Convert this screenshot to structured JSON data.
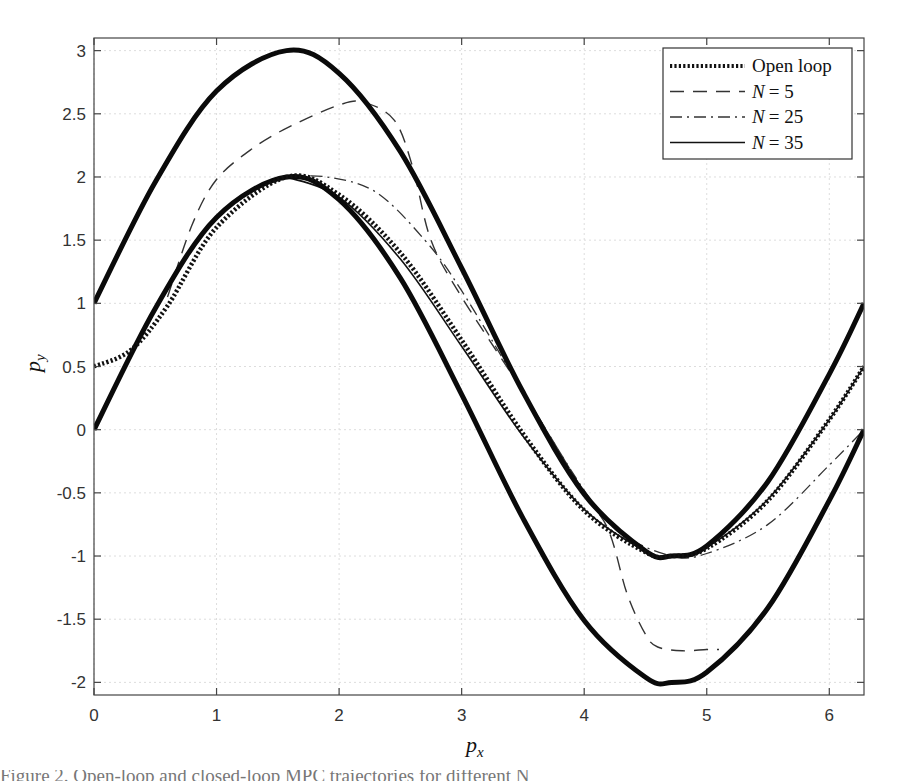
{
  "chart_data": {
    "type": "line",
    "title": "",
    "xlabel": "p_x",
    "ylabel": "p_y",
    "xlim": [
      0,
      6.2832
    ],
    "ylim": [
      -2.1,
      3.1
    ],
    "xticks": [
      0,
      1,
      2,
      3,
      4,
      5,
      6
    ],
    "xtick_labels": [
      "0",
      "1",
      "2",
      "3",
      "4",
      "5",
      "6"
    ],
    "yticks": [
      3,
      2.5,
      2,
      1.5,
      1,
      0.5,
      0,
      -0.5,
      -1,
      -1.5,
      -2
    ],
    "ytick_labels": [
      "3",
      "2.5",
      "2",
      "1.5",
      "1",
      "0.5",
      "0",
      "-0.5",
      "-1",
      "-1.5",
      "-2"
    ],
    "grid": true,
    "legend_position": "upper right",
    "legend": [
      {
        "label": "Open loop",
        "style": "dotted-thick"
      },
      {
        "label_var": "N",
        "label_eq": "= 5",
        "style": "dashed"
      },
      {
        "label_var": "N",
        "label_eq": "= 25",
        "style": "dash-dot"
      },
      {
        "label_var": "N",
        "label_eq": "= 35",
        "style": "solid-thin"
      }
    ],
    "series": [
      {
        "name": "Upper bound",
        "style": "solid-thick",
        "x": [
          0,
          0.5,
          1.0,
          1.5708,
          2.0,
          2.5,
          3.0,
          3.5,
          4.0,
          4.5,
          4.7124,
          5.0,
          5.5,
          6.0,
          6.2832
        ],
        "y": [
          1.0,
          1.96,
          2.68,
          3.0,
          2.82,
          2.2,
          1.28,
          0.3,
          -0.51,
          -0.96,
          -1.0,
          -0.92,
          -0.41,
          0.44,
          1.0
        ]
      },
      {
        "name": "Lower bound",
        "style": "solid-thick",
        "x": [
          0,
          0.5,
          1.0,
          1.5708,
          2.0,
          2.5,
          3.0,
          3.5,
          4.0,
          4.5,
          4.7124,
          5.0,
          5.5,
          6.0,
          6.2832
        ],
        "y": [
          0.0,
          0.96,
          1.68,
          2.0,
          1.82,
          1.2,
          0.28,
          -0.7,
          -1.51,
          -1.96,
          -2.0,
          -1.92,
          -1.41,
          -0.56,
          0.0
        ]
      },
      {
        "name": "Open loop",
        "style": "dotted-thick",
        "x": [
          0,
          0.3,
          0.6,
          1.0,
          1.5708,
          2.0,
          2.5,
          3.0,
          3.5,
          4.0,
          4.5,
          4.7124,
          5.0,
          5.5,
          6.0,
          6.2832
        ],
        "y": [
          0.5,
          0.63,
          0.98,
          1.6,
          2.0,
          1.86,
          1.4,
          0.71,
          -0.03,
          -0.64,
          -0.97,
          -1.0,
          -0.94,
          -0.56,
          0.08,
          0.5
        ]
      },
      {
        "name": "N = 5",
        "style": "dashed",
        "x": [
          0.6,
          0.8,
          1.0,
          1.3,
          1.6,
          2.0,
          2.2,
          2.45,
          2.6,
          2.75,
          3.0,
          3.5,
          4.0,
          4.2,
          4.35,
          4.5,
          4.6,
          4.8,
          5.0,
          5.1
        ],
        "y": [
          1.05,
          1.62,
          1.98,
          2.23,
          2.4,
          2.57,
          2.59,
          2.45,
          2.08,
          1.5,
          1.05,
          0.3,
          -0.5,
          -0.8,
          -1.3,
          -1.62,
          -1.72,
          -1.75,
          -1.74,
          -1.74
        ]
      },
      {
        "name": "N = 25",
        "style": "dash-dot",
        "x": [
          1.5708,
          1.9,
          2.3,
          2.7,
          3.0,
          3.5,
          4.0,
          4.3,
          4.7124,
          5.0,
          5.5,
          6.0,
          6.2832
        ],
        "y": [
          2.0,
          2.0,
          1.88,
          1.5,
          1.1,
          0.3,
          -0.48,
          -0.82,
          -1.0,
          -0.98,
          -0.75,
          -0.28,
          0.0
        ]
      },
      {
        "name": "N = 35",
        "style": "solid-thin",
        "x": [
          1.5708,
          2.0,
          2.5,
          3.0,
          3.5,
          4.0,
          4.5,
          4.7124,
          5.0,
          5.5,
          6.0,
          6.2832
        ],
        "y": [
          2.0,
          1.84,
          1.35,
          0.66,
          -0.05,
          -0.63,
          -0.96,
          -1.0,
          -0.93,
          -0.55,
          0.08,
          0.5
        ]
      }
    ]
  },
  "caption": {
    "text": "Figure 2.  Open-loop and closed-loop MPC trajectories for different N"
  }
}
